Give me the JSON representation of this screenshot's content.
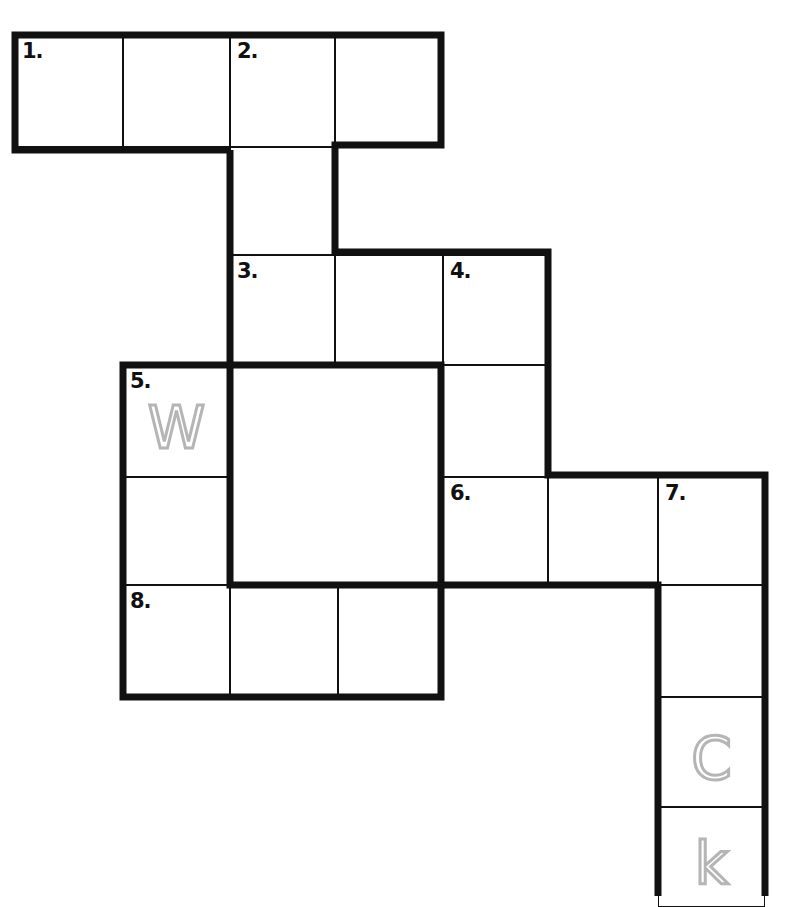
{
  "puzzle": {
    "type": "crossword",
    "clue_numbers": [
      "1.",
      "2.",
      "3.",
      "4.",
      "5.",
      "6.",
      "7.",
      "8."
    ],
    "cells": [
      {
        "id": "r0c0",
        "x": 15,
        "y": 35,
        "w": 108,
        "h": 112,
        "number": "1.",
        "hint": ""
      },
      {
        "id": "r0c1",
        "x": 123,
        "y": 35,
        "w": 107,
        "h": 112,
        "number": "",
        "hint": ""
      },
      {
        "id": "r0c2",
        "x": 230,
        "y": 35,
        "w": 105,
        "h": 112,
        "number": "2.",
        "hint": ""
      },
      {
        "id": "r0c3",
        "x": 335,
        "y": 35,
        "w": 106,
        "h": 112,
        "number": "",
        "hint": ""
      },
      {
        "id": "r1c2",
        "x": 230,
        "y": 147,
        "w": 105,
        "h": 108,
        "number": "",
        "hint": ""
      },
      {
        "id": "r2c2",
        "x": 230,
        "y": 255,
        "w": 105,
        "h": 110,
        "number": "3.",
        "hint": ""
      },
      {
        "id": "r2c3",
        "x": 335,
        "y": 255,
        "w": 108,
        "h": 110,
        "number": "",
        "hint": ""
      },
      {
        "id": "r2c4",
        "x": 443,
        "y": 255,
        "w": 105,
        "h": 110,
        "number": "4.",
        "hint": ""
      },
      {
        "id": "r3c1",
        "x": 123,
        "y": 365,
        "w": 107,
        "h": 112,
        "number": "5.",
        "hint": "W"
      },
      {
        "id": "r3c4",
        "x": 443,
        "y": 365,
        "w": 105,
        "h": 112,
        "number": "",
        "hint": ""
      },
      {
        "id": "r4c1",
        "x": 123,
        "y": 477,
        "w": 107,
        "h": 108,
        "number": "",
        "hint": ""
      },
      {
        "id": "r4c4",
        "x": 443,
        "y": 477,
        "w": 105,
        "h": 108,
        "number": "6.",
        "hint": ""
      },
      {
        "id": "r4c5",
        "x": 548,
        "y": 477,
        "w": 110,
        "h": 108,
        "number": "",
        "hint": ""
      },
      {
        "id": "r4c6",
        "x": 658,
        "y": 477,
        "w": 107,
        "h": 108,
        "number": "7.",
        "hint": ""
      },
      {
        "id": "r5c1",
        "x": 123,
        "y": 585,
        "w": 107,
        "h": 112,
        "number": "8.",
        "hint": ""
      },
      {
        "id": "r5c2",
        "x": 230,
        "y": 585,
        "w": 108,
        "h": 112,
        "number": "",
        "hint": ""
      },
      {
        "id": "r5c3",
        "x": 338,
        "y": 585,
        "w": 103,
        "h": 112,
        "number": "",
        "hint": ""
      },
      {
        "id": "r5c6",
        "x": 658,
        "y": 585,
        "w": 107,
        "h": 112,
        "number": "",
        "hint": ""
      },
      {
        "id": "r6c6",
        "x": 658,
        "y": 697,
        "w": 107,
        "h": 110,
        "number": "",
        "hint": "C"
      },
      {
        "id": "r7c6",
        "x": 658,
        "y": 807,
        "w": 107,
        "h": 100,
        "number": "",
        "hint": "k"
      }
    ],
    "colors": {
      "line": "#111111",
      "hint_letters": "#b5b5b5",
      "background": "#ffffff"
    }
  }
}
